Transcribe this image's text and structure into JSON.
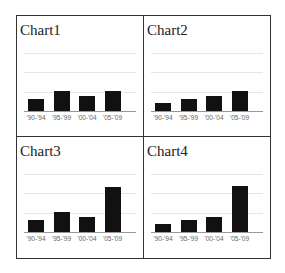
{
  "chart_data": [
    {
      "type": "bar",
      "title": "Chart1",
      "categories": [
        "'90-'94",
        "'95-'99",
        "'00-'04",
        "'05-'09"
      ],
      "values": [
        0.6,
        1.0,
        0.77,
        1.0
      ],
      "xlabel": "",
      "ylabel": "",
      "ylim": [
        0,
        3
      ],
      "grid": true,
      "legend": "none"
    },
    {
      "type": "bar",
      "title": "Chart2",
      "categories": [
        "'90-'94",
        "'95-'99",
        "'00-'04",
        "'05-'09"
      ],
      "values": [
        0.4,
        0.6,
        0.77,
        1.0
      ],
      "xlabel": "",
      "ylabel": "",
      "ylim": [
        0,
        3
      ],
      "grid": true,
      "legend": "none"
    },
    {
      "type": "bar",
      "title": "Chart3",
      "categories": [
        "'90-'94",
        "'95-'99",
        "'00-'04",
        "'05-'09"
      ],
      "values": [
        0.6,
        1.0,
        0.77,
        2.3
      ],
      "xlabel": "",
      "ylabel": "",
      "ylim": [
        0,
        3
      ],
      "grid": true,
      "legend": "none"
    },
    {
      "type": "bar",
      "title": "Chart4",
      "categories": [
        "'90-'94",
        "'95-'99",
        "'00-'04",
        "'05-'09"
      ],
      "values": [
        0.4,
        0.6,
        0.77,
        2.35
      ],
      "xlabel": "",
      "ylabel": "",
      "ylim": [
        0,
        3
      ],
      "grid": true,
      "legend": "none"
    }
  ],
  "colors": {
    "bar": "#111111",
    "grid": "#e6e6e6",
    "border": "#333333"
  }
}
